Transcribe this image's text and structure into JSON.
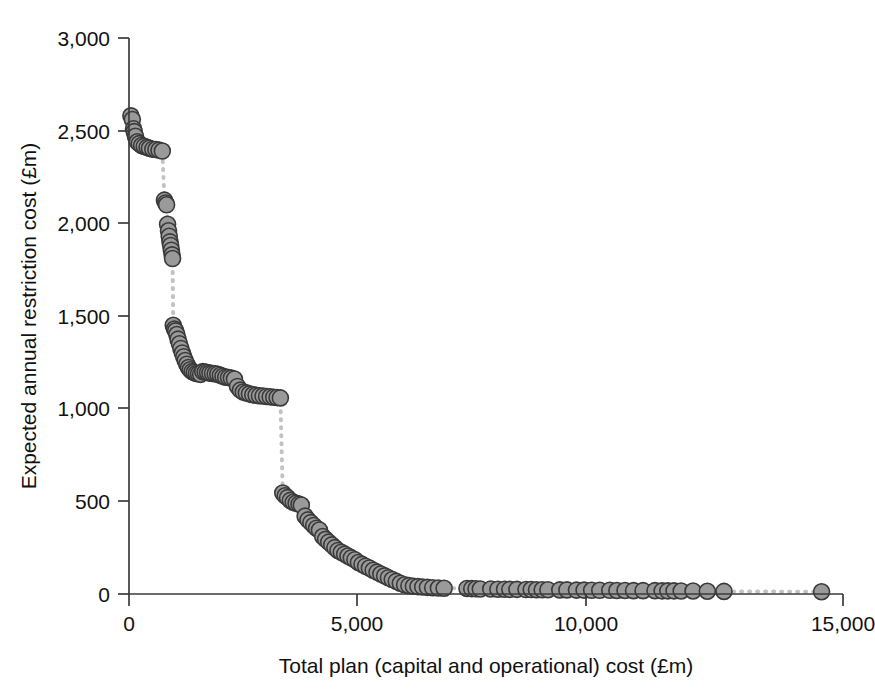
{
  "chart_data": {
    "type": "scatter",
    "title": "",
    "subtitle": "",
    "xlabel": "Total plan (capital and operational) cost (£m)",
    "ylabel": "Expected annual restriction cost (£m)",
    "xlim": [
      0,
      15000
    ],
    "ylim": [
      0,
      3000
    ],
    "xticks": [
      0,
      5000,
      10000,
      15000
    ],
    "xtick_labels": [
      "0",
      "5,000",
      "10,000",
      "15,000"
    ],
    "yticks": [
      0,
      500,
      1000,
      1500,
      2000,
      2500,
      3000
    ],
    "ytick_labels": [
      "0",
      "500",
      "1,000",
      "1,500",
      "2,000",
      "2,500",
      "3,000"
    ],
    "grid": false,
    "legend": null,
    "marker_style": {
      "shape": "circle",
      "fill_color": "#9a9a9a",
      "edge_color": "#3a3a3a",
      "radius_px": 8
    },
    "line_style": {
      "type": "dotted",
      "color": "#c2c2c2",
      "width_px": 4
    },
    "series": [
      {
        "name": "Cost-effectiveness frontier",
        "points": [
          [
            40,
            2580
          ],
          [
            70,
            2560
          ],
          [
            95,
            2510
          ],
          [
            110,
            2495
          ],
          [
            135,
            2470
          ],
          [
            175,
            2440
          ],
          [
            215,
            2430
          ],
          [
            265,
            2420
          ],
          [
            320,
            2415
          ],
          [
            380,
            2410
          ],
          [
            430,
            2405
          ],
          [
            500,
            2400
          ],
          [
            565,
            2398
          ],
          [
            630,
            2395
          ],
          [
            700,
            2390
          ],
          [
            745,
            2125
          ],
          [
            770,
            2110
          ],
          [
            790,
            2100
          ],
          [
            810,
            1995
          ],
          [
            830,
            1960
          ],
          [
            845,
            1930
          ],
          [
            860,
            1900
          ],
          [
            875,
            1880
          ],
          [
            890,
            1855
          ],
          [
            905,
            1830
          ],
          [
            915,
            1810
          ],
          [
            930,
            1450
          ],
          [
            955,
            1430
          ],
          [
            980,
            1420
          ],
          [
            1005,
            1400
          ],
          [
            1030,
            1375
          ],
          [
            1060,
            1350
          ],
          [
            1090,
            1325
          ],
          [
            1120,
            1300
          ],
          [
            1150,
            1280
          ],
          [
            1180,
            1260
          ],
          [
            1215,
            1240
          ],
          [
            1250,
            1222
          ],
          [
            1285,
            1210
          ],
          [
            1325,
            1200
          ],
          [
            1370,
            1195
          ],
          [
            1415,
            1190
          ],
          [
            1460,
            1188
          ],
          [
            1505,
            1185
          ],
          [
            1550,
            1200
          ],
          [
            1600,
            1198
          ],
          [
            1650,
            1195
          ],
          [
            1700,
            1192
          ],
          [
            1755,
            1190
          ],
          [
            1810,
            1188
          ],
          [
            1865,
            1186
          ],
          [
            1920,
            1180
          ],
          [
            1975,
            1175
          ],
          [
            2030,
            1170
          ],
          [
            2090,
            1168
          ],
          [
            2150,
            1165
          ],
          [
            2215,
            1160
          ],
          [
            2280,
            1120
          ],
          [
            2340,
            1100
          ],
          [
            2400,
            1090
          ],
          [
            2465,
            1085
          ],
          [
            2530,
            1080
          ],
          [
            2600,
            1075
          ],
          [
            2670,
            1072
          ],
          [
            2740,
            1070
          ],
          [
            2815,
            1068
          ],
          [
            2890,
            1066
          ],
          [
            2965,
            1064
          ],
          [
            3040,
            1062
          ],
          [
            3110,
            1060
          ],
          [
            3180,
            1058
          ],
          [
            3230,
            545
          ],
          [
            3280,
            530
          ],
          [
            3330,
            520
          ],
          [
            3390,
            505
          ],
          [
            3450,
            495
          ],
          [
            3510,
            490
          ],
          [
            3570,
            485
          ],
          [
            3620,
            480
          ],
          [
            3700,
            420
          ],
          [
            3760,
            400
          ],
          [
            3820,
            385
          ],
          [
            3880,
            370
          ],
          [
            3940,
            355
          ],
          [
            4000,
            345
          ],
          [
            4070,
            310
          ],
          [
            4130,
            295
          ],
          [
            4195,
            280
          ],
          [
            4260,
            265
          ],
          [
            4325,
            250
          ],
          [
            4390,
            235
          ],
          [
            4460,
            225
          ],
          [
            4530,
            215
          ],
          [
            4600,
            205
          ],
          [
            4670,
            195
          ],
          [
            4745,
            185
          ],
          [
            4820,
            170
          ],
          [
            4895,
            160
          ],
          [
            4970,
            150
          ],
          [
            5050,
            140
          ],
          [
            5130,
            128
          ],
          [
            5210,
            118
          ],
          [
            5290,
            108
          ],
          [
            5370,
            98
          ],
          [
            5450,
            88
          ],
          [
            5530,
            78
          ],
          [
            5615,
            68
          ],
          [
            5700,
            58
          ],
          [
            5790,
            50
          ],
          [
            5880,
            45
          ],
          [
            5975,
            42
          ],
          [
            6070,
            40
          ],
          [
            6170,
            38
          ],
          [
            6270,
            36
          ],
          [
            6380,
            34
          ],
          [
            6500,
            32
          ],
          [
            6620,
            31
          ],
          [
            7100,
            30
          ],
          [
            7200,
            29
          ],
          [
            7290,
            28
          ],
          [
            7380,
            27
          ],
          [
            7600,
            27
          ],
          [
            7750,
            26
          ],
          [
            7890,
            26
          ],
          [
            8000,
            25
          ],
          [
            8150,
            25
          ],
          [
            8340,
            24
          ],
          [
            8450,
            24
          ],
          [
            8560,
            23
          ],
          [
            8680,
            23
          ],
          [
            8800,
            23
          ],
          [
            9050,
            22
          ],
          [
            9200,
            22
          ],
          [
            9400,
            21
          ],
          [
            9560,
            21
          ],
          [
            9720,
            20
          ],
          [
            9890,
            20
          ],
          [
            10100,
            20
          ],
          [
            10250,
            19
          ],
          [
            10420,
            19
          ],
          [
            10600,
            18
          ],
          [
            10800,
            18
          ],
          [
            11050,
            18
          ],
          [
            11200,
            17
          ],
          [
            11320,
            17
          ],
          [
            11450,
            17
          ],
          [
            11600,
            16
          ],
          [
            11850,
            16
          ],
          [
            12150,
            15
          ],
          [
            12500,
            14
          ],
          [
            14550,
            12
          ]
        ]
      }
    ]
  },
  "axis": {
    "x_title": "Total plan (capital and operational) cost (£m)",
    "y_title": "Expected annual restriction cost (£m)",
    "x_tick_0": "0",
    "x_tick_1": "5,000",
    "x_tick_2": "10,000",
    "x_tick_3": "15,000",
    "y_tick_0": "0",
    "y_tick_1": "500",
    "y_tick_2": "1,000",
    "y_tick_3": "1,500",
    "y_tick_4": "2,000",
    "y_tick_5": "2,500",
    "y_tick_6": "3,000"
  },
  "colors": {
    "marker_fill": "#9a9a9a",
    "marker_edge": "#3a3a3a",
    "connector": "#c2c2c2",
    "axis": "#3b3b3b",
    "text": "#111111",
    "background": "#ffffff"
  }
}
